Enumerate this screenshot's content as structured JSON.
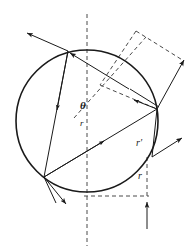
{
  "figure": {
    "background_color": "#ffffff",
    "stroke_color": "#1a1a1a",
    "dash_color": "#555555",
    "width": 195,
    "height": 252
  },
  "labels": {
    "theta": "θ",
    "r_inner": "r",
    "r_prime": "r′",
    "r_bottom": "r"
  },
  "geometry": {
    "circle": {
      "cx": 87,
      "cy": 121,
      "r": 71
    },
    "axis": {
      "x": 87,
      "y1": 14,
      "y2": 246
    },
    "points": {
      "entry": [
        68,
        51
      ],
      "bottom_left": [
        44,
        177
      ],
      "right": [
        157,
        109
      ],
      "exit": [
        152,
        157
      ],
      "foot": [
        147,
        196
      ],
      "center": [
        87,
        196
      ]
    },
    "parallelogram": [
      [
        136,
        31
      ],
      [
        184,
        61
      ],
      [
        157,
        109
      ],
      [
        100,
        85
      ]
    ],
    "arrow_up": {
      "x": 147,
      "y_tail": 229,
      "y_head": 201
    }
  },
  "label_positions": {
    "theta": [
      80,
      108
    ],
    "r_inner": [
      80,
      126
    ],
    "r_prime": [
      136,
      145
    ],
    "r_bottom": [
      138,
      178
    ]
  }
}
